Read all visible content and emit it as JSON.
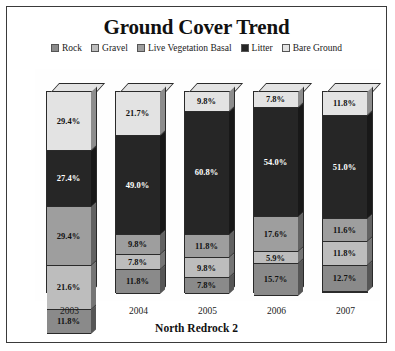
{
  "chart_data": {
    "type": "bar",
    "subtype": "stacked-100-3d",
    "title": "Ground Cover Trend",
    "xlabel": "North Redrock 2",
    "ylabel": "",
    "categories": [
      "2003",
      "2004",
      "2005",
      "2006",
      "2007"
    ],
    "ylim": [
      0,
      100
    ],
    "grid": false,
    "legend_position": "top",
    "units": "%",
    "series": [
      {
        "name": "Rock",
        "color": "#8a8a8a",
        "values": [
          11.8,
          11.8,
          7.8,
          15.7,
          12.7
        ],
        "labels": [
          "11.8%",
          "11.8%",
          "7.8%",
          "15.7%",
          "12.7%"
        ]
      },
      {
        "name": "Gravel",
        "color": "#bdbdbd",
        "values": [
          21.6,
          7.8,
          9.8,
          5.9,
          11.8
        ],
        "labels": [
          "21.6%",
          "7.8%",
          "9.8%",
          "5.9%",
          "11.8%"
        ]
      },
      {
        "name": "Live Vegetation Basal",
        "color": "#9e9e9e",
        "values": [
          29.4,
          9.8,
          11.8,
          17.6,
          11.6
        ],
        "labels": [
          "29.4%",
          "9.8%",
          "11.8%",
          "17.6%",
          "11.6%"
        ]
      },
      {
        "name": "Litter",
        "color": "#262626",
        "values": [
          27.4,
          49.0,
          60.8,
          54.0,
          51.0
        ],
        "labels": [
          "27.4%",
          "49.0%",
          "60.8%",
          "54.0%",
          "51.0%"
        ]
      },
      {
        "name": "Bare Ground",
        "color": "#e3e3e3",
        "values": [
          29.4,
          21.7,
          9.8,
          7.8,
          11.8
        ],
        "labels": [
          "29.4%",
          "21.7%",
          "9.8%",
          "7.8%",
          "11.8%"
        ]
      }
    ]
  },
  "legend": {
    "items": [
      {
        "label": "Rock",
        "color": "#8a8a8a"
      },
      {
        "label": "Gravel",
        "color": "#bdbdbd"
      },
      {
        "label": "Live Vegetation Basal",
        "color": "#9e9e9e"
      },
      {
        "label": "Litter",
        "color": "#262626"
      },
      {
        "label": "Bare Ground",
        "color": "#e3e3e3"
      }
    ]
  }
}
